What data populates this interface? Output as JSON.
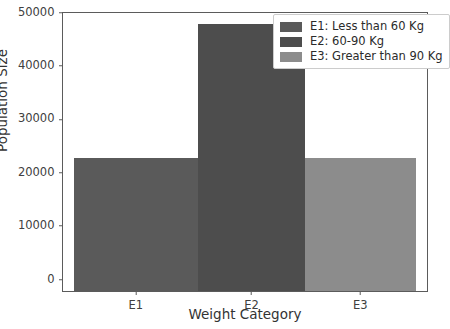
{
  "chart_data": {
    "type": "bar",
    "title": "",
    "xlabel": "Weight Category",
    "ylabel": "Population Size",
    "categories": [
      "E1",
      "E2",
      "E3"
    ],
    "values": [
      25000,
      50000,
      25000
    ],
    "bar_colors": [
      "#5a5a5a",
      "#4d4d4d",
      "#8c8c8c"
    ],
    "ylim": [
      0,
      52000
    ],
    "yticks": [
      0,
      10000,
      20000,
      30000,
      40000,
      50000
    ],
    "ytick_labels": [
      "0",
      "10000",
      "20000",
      "30000",
      "40000",
      "50000"
    ],
    "xtick_labels": [
      "E1",
      "E2",
      "E3"
    ],
    "grid": false,
    "legend_position": "upper right",
    "legend": [
      {
        "label": "E1: Less than 60 Kg",
        "color": "#5a5a5a"
      },
      {
        "label": "E2: 60-90 Kg",
        "color": "#4d4d4d"
      },
      {
        "label": "E3: Greater than 90 Kg",
        "color": "#8c8c8c"
      }
    ],
    "bar_geometry": [
      {
        "category": "E1",
        "left_pct": 3.0,
        "width_pct": 34.15
      },
      {
        "category": "E2",
        "left_pct": 37.15,
        "width_pct": 29.3
      },
      {
        "category": "E3",
        "left_pct": 66.45,
        "width_pct": 30.55
      }
    ],
    "bar_height_pct": [
      48.0,
      96.0,
      48.0
    ],
    "xtick_pos_pct": [
      20.0,
      51.8,
      81.7
    ],
    "ytick_pos_pct": [
      0,
      19.2,
      38.4,
      57.6,
      76.8,
      96.0
    ],
    "axes_color": "#5b5b5b",
    "background": "#ffffff"
  }
}
